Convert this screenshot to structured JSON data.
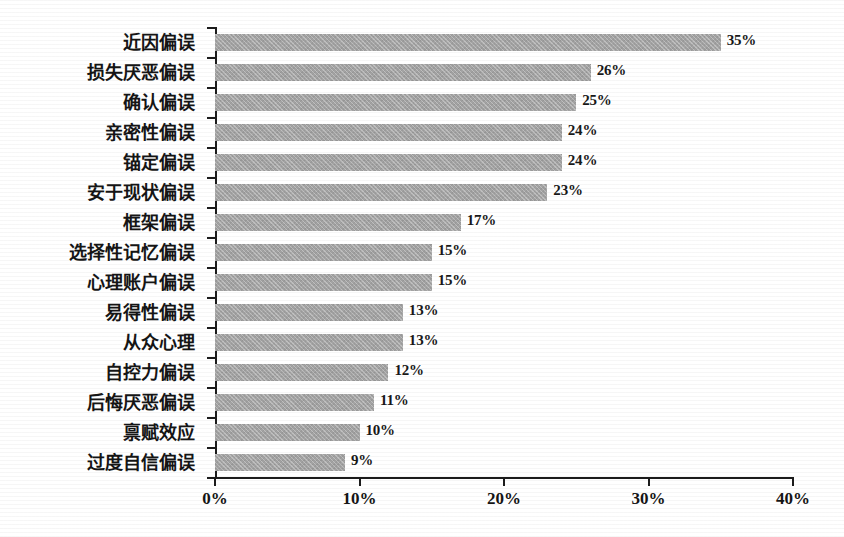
{
  "chart_data": {
    "type": "bar",
    "orientation": "horizontal",
    "title": "",
    "xlabel": "",
    "ylabel": "",
    "xlim": [
      0,
      40
    ],
    "xticks": [
      0,
      10,
      20,
      30,
      40
    ],
    "xtick_labels": [
      "0%",
      "10%",
      "20%",
      "30%",
      "40%"
    ],
    "grid": false,
    "legend": null,
    "value_suffix": "%",
    "bar_color": "#a3a3a3",
    "axis_color": "#1c1c1c",
    "background_color": "#ffffff",
    "categories": [
      "近因偏误",
      "损失厌恶偏误",
      "确认偏误",
      "亲密性偏误",
      "锚定偏误",
      "安于现状偏误",
      "框架偏误",
      "选择性记忆偏误",
      "心理账户偏误",
      "易得性偏误",
      "从众心理",
      "自控力偏误",
      "后悔厌恶偏误",
      "禀赋效应",
      "过度自信偏误"
    ],
    "values": [
      35,
      26,
      25,
      24,
      24,
      23,
      17,
      15,
      15,
      13,
      13,
      12,
      11,
      10,
      9
    ],
    "data_labels": [
      "35%",
      "26%",
      "25%",
      "24%",
      "24%",
      "23%",
      "17%",
      "15%",
      "15%",
      "13%",
      "13%",
      "12%",
      "11%",
      "10%",
      "9%"
    ]
  }
}
